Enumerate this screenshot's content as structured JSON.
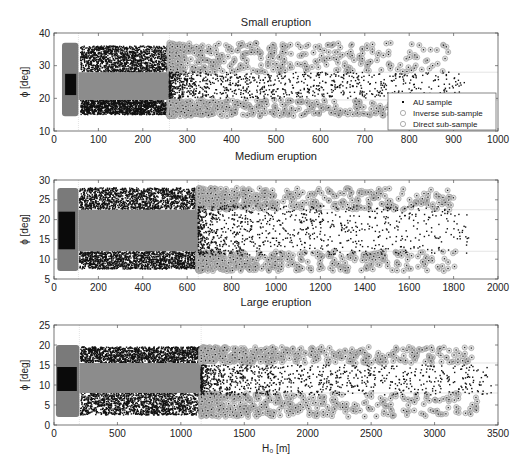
{
  "chart_data": [
    {
      "type": "scatter",
      "title": "Small eruption",
      "xlabel": "",
      "ylabel": "ϕ [deg]",
      "xlim": [
        0,
        1000
      ],
      "ylim": [
        10,
        40
      ],
      "xticks": [
        0,
        100,
        200,
        300,
        400,
        500,
        600,
        700,
        800,
        900,
        1000
      ],
      "yticks": [
        10,
        20,
        30,
        40
      ],
      "reference_lines": {
        "vertical_x": [
          55,
          260
        ],
        "horizontal_y": [
          19.5,
          28
        ]
      },
      "legend": {
        "position": "bottom-right",
        "entries": [
          "AU sample",
          "Inverse sub-sample",
          "Direct sub-sample"
        ]
      },
      "regions": {
        "inverse_block": {
          "x": [
            18,
            55
          ],
          "y": [
            14.5,
            37
          ]
        },
        "inverse_core": {
          "x": [
            25,
            50
          ],
          "y": [
            21,
            27.5
          ]
        },
        "direct_band": {
          "x": [
            55,
            260
          ],
          "y": [
            19.5,
            28
          ]
        },
        "au_upper": {
          "x": [
            60,
            260
          ],
          "y": [
            28,
            36
          ]
        },
        "au_lower": {
          "x": [
            60,
            260
          ],
          "y": [
            15,
            19.5
          ]
        },
        "tail_x_max": 925,
        "tail_au_y": [
          20,
          28
        ],
        "tail_ring_y": [
          14.5,
          37
        ]
      }
    },
    {
      "type": "scatter",
      "title": "Medium eruption",
      "xlabel": "",
      "ylabel": "ϕ [deg]",
      "xlim": [
        0,
        2000
      ],
      "ylim": [
        5,
        30
      ],
      "xticks": [
        0,
        200,
        400,
        600,
        800,
        1000,
        1200,
        1400,
        1600,
        1800,
        2000
      ],
      "yticks": [
        5,
        10,
        15,
        20,
        25,
        30
      ],
      "reference_lines": {
        "vertical_x": [
          110,
          650
        ],
        "horizontal_y": [
          12,
          22.5
        ]
      },
      "regions": {
        "inverse_block": {
          "x": [
            15,
            110
          ],
          "y": [
            7,
            28
          ]
        },
        "inverse_core": {
          "x": [
            20,
            95
          ],
          "y": [
            12.5,
            22
          ]
        },
        "direct_band": {
          "x": [
            110,
            650
          ],
          "y": [
            12,
            22.5
          ]
        },
        "au_upper": {
          "x": [
            115,
            650
          ],
          "y": [
            22.5,
            28
          ]
        },
        "au_lower": {
          "x": [
            115,
            650
          ],
          "y": [
            7.5,
            12
          ]
        },
        "tail_x_max": 1870,
        "tail_au_y": [
          11,
          23.5
        ],
        "tail_ring_y": [
          7,
          28
        ]
      }
    },
    {
      "type": "scatter",
      "title": "Large eruption",
      "xlabel": "H₀ [m]",
      "ylabel": "ϕ [deg]",
      "xlim": [
        0,
        3500
      ],
      "ylim": [
        0,
        25
      ],
      "xticks": [
        0,
        500,
        1000,
        1500,
        2000,
        2500,
        3000,
        3500
      ],
      "yticks": [
        0,
        5,
        10,
        15,
        20,
        25
      ],
      "reference_lines": {
        "vertical_x": [
          200,
          1160
        ],
        "horizontal_y": [
          8,
          15.5
        ]
      },
      "regions": {
        "inverse_block": {
          "x": [
            15,
            200
          ],
          "y": [
            2,
            20
          ]
        },
        "inverse_core": {
          "x": [
            25,
            180
          ],
          "y": [
            8.5,
            14.5
          ]
        },
        "direct_band": {
          "x": [
            200,
            1160
          ],
          "y": [
            8,
            15.5
          ]
        },
        "au_upper": {
          "x": [
            210,
            1160
          ],
          "y": [
            15.5,
            19.5
          ]
        },
        "au_lower": {
          "x": [
            210,
            1160
          ],
          "y": [
            2.5,
            8
          ]
        },
        "tail_x_max": 3450,
        "tail_au_y": [
          7.5,
          15
        ],
        "tail_ring_y": [
          2,
          19.5
        ]
      }
    }
  ],
  "colors": {
    "au": "#111111",
    "inverse": "#7a7a7a",
    "direct": "#8c8c8c",
    "ring": "#999999",
    "grid": "#d9d9d9",
    "axis": "#555555"
  },
  "caption_fragment": ""
}
